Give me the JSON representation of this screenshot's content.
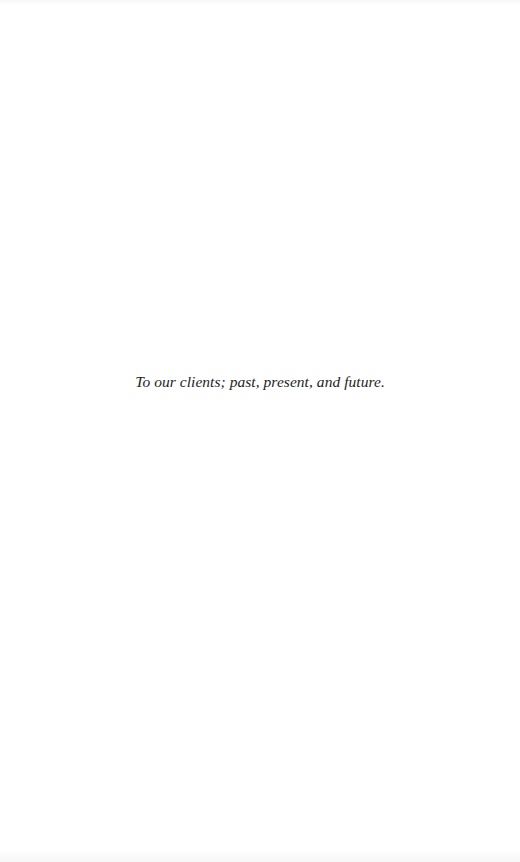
{
  "page": {
    "dedication": "To our clients; past, present, and future."
  },
  "colors": {
    "background": "#ffffff",
    "text": "#1e1e1e"
  }
}
